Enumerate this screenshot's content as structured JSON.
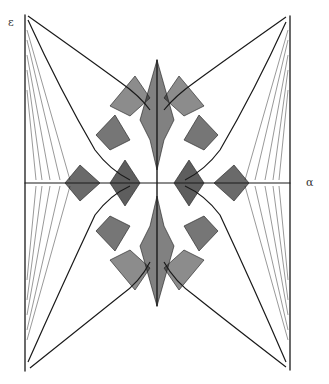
{
  "figure": {
    "y_axis_label": "ε",
    "x_axis_label": "α",
    "ink_color": "#1a1a1a",
    "background": "#ffffff"
  }
}
